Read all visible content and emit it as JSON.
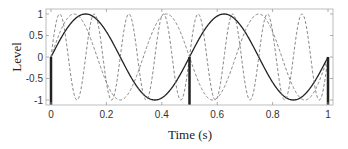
{
  "chart_data": {
    "type": "line",
    "title": "",
    "xlabel": "Time (s)",
    "ylabel": "Level",
    "xlim": [
      0,
      1
    ],
    "ylim": [
      -1.05,
      1.05
    ],
    "grid": false,
    "legend": null,
    "xticks": [
      0,
      0.2,
      0.4,
      0.6,
      0.8,
      1
    ],
    "xtick_labels": [
      "0",
      "0.2",
      "0.4",
      "0.6",
      "0.8",
      "1"
    ],
    "yticks": [
      1,
      0.5,
      0,
      -0.5,
      -1
    ],
    "ytick_labels": [
      "1",
      "0.5",
      "0",
      "-0.5",
      "-1"
    ],
    "series": [
      {
        "name": "2 Hz sine",
        "style": "solid",
        "color": "#222222",
        "frequency_hz": 2,
        "x": [
          0,
          0.125,
          0.25,
          0.375,
          0.5,
          0.625,
          0.75,
          0.875,
          1
        ],
        "values": [
          0,
          1,
          0,
          -1,
          0,
          1,
          0,
          -1,
          0
        ]
      },
      {
        "name": "3 Hz sine",
        "style": "dashed",
        "color": "#777777",
        "frequency_hz": 3,
        "x": [
          0,
          0.083,
          0.25,
          0.417,
          0.583,
          0.75,
          0.917,
          1
        ],
        "values": [
          0,
          1,
          -1,
          1,
          -1,
          1,
          -1,
          0
        ]
      },
      {
        "name": "8 Hz sine",
        "style": "dashed",
        "color": "#777777",
        "frequency_hz": 8,
        "x": [
          0,
          0.031,
          0.094,
          0.156,
          0.219,
          0.281,
          0.344,
          0.406,
          0.469,
          0.531,
          0.594,
          0.656,
          0.719,
          0.781,
          0.844,
          0.906,
          0.969,
          1
        ],
        "values": [
          0,
          1,
          -1,
          1,
          -1,
          1,
          -1,
          1,
          -1,
          1,
          -1,
          1,
          -1,
          1,
          -1,
          1,
          -1,
          0
        ]
      }
    ],
    "samples": {
      "style": "thick-stem",
      "color": "#222222",
      "x": [
        0,
        0.5,
        1
      ],
      "values": [
        0,
        0,
        0
      ]
    }
  }
}
